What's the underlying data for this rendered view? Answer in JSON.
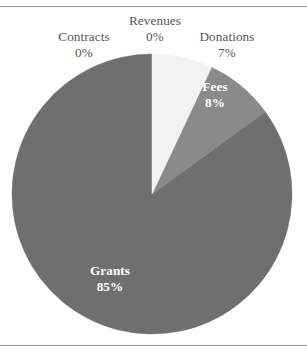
{
  "figure": {
    "border_color": "#9a9a9a",
    "background": "#ffffff"
  },
  "chart_data": {
    "type": "pie",
    "title": "",
    "subtitle": "",
    "xlabel": "",
    "ylabel": "",
    "legend_position": "none",
    "grid": false,
    "units": "percent",
    "start_angle_deg": 0,
    "direction": "clockwise",
    "categories": [
      "Revenues",
      "Donations",
      "Fees",
      "Grants",
      "Contracts"
    ],
    "values": [
      0,
      7,
      8,
      85,
      0
    ],
    "value_labels": [
      "0%",
      "7%",
      "8%",
      "85%",
      "0%"
    ],
    "slices": [
      {
        "name": "Revenues",
        "value": 0,
        "value_label": "0%",
        "color": "#f2f2f2",
        "label_placement": "outside",
        "label_color": "#565656"
      },
      {
        "name": "Donations",
        "value": 7,
        "value_label": "7%",
        "color": "#f2f2f2",
        "label_placement": "outside",
        "label_color": "#565656"
      },
      {
        "name": "Fees",
        "value": 8,
        "value_label": "8%",
        "color": "#8a8a8a",
        "label_placement": "inside",
        "label_color": "#ffffff"
      },
      {
        "name": "Grants",
        "value": 85,
        "value_label": "85%",
        "color": "#6f6f6f",
        "label_placement": "inside",
        "label_color": "#ffffff"
      },
      {
        "name": "Contracts",
        "value": 0,
        "value_label": "0%",
        "color": "#6f6f6f",
        "label_placement": "outside",
        "label_color": "#565656"
      }
    ]
  },
  "geometry": {
    "center_x": 152,
    "center_y": 187,
    "radius": 140
  }
}
